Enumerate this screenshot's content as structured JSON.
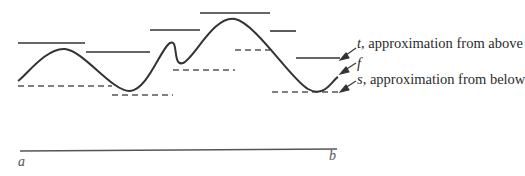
{
  "figure": {
    "colors": {
      "curve": "#333333",
      "steps": "#333333",
      "dashed": "#555555",
      "axis": "#555555"
    }
  },
  "labels": {
    "upper": {
      "symbol": "t",
      "text": ", approximation from above"
    },
    "curve": {
      "symbol": "f",
      "text": ""
    },
    "lower": {
      "symbol": "s",
      "text": ", approximation from below"
    },
    "interval_start": "a",
    "interval_end": "b"
  },
  "chart_data": {
    "type": "line",
    "title": "",
    "xlabel": "",
    "ylabel": "",
    "interval": [
      "a",
      "b"
    ],
    "curve_f": {
      "name": "f",
      "points_px": [
        [
          18,
          81
        ],
        [
          65,
          49
        ],
        [
          130,
          91
        ],
        [
          170,
          43
        ],
        [
          183,
          63
        ],
        [
          235,
          19
        ],
        [
          308,
          89
        ],
        [
          338,
          77
        ]
      ]
    },
    "upper_step_t": {
      "name": "t, approximation from above",
      "style": "solid",
      "segments_px": [
        [
          18,
          85,
          43
        ],
        [
          86,
          150,
          52
        ],
        [
          150,
          200,
          30
        ],
        [
          200,
          270,
          13
        ],
        [
          270,
          296,
          31
        ],
        [
          296,
          340,
          58
        ]
      ]
    },
    "lower_step_s": {
      "name": "s, approximation from below",
      "style": "dashed",
      "segments_px": [
        [
          18,
          112,
          86
        ],
        [
          112,
          173,
          95
        ],
        [
          173,
          235,
          70
        ],
        [
          235,
          270,
          50
        ],
        [
          272,
          338,
          92
        ]
      ]
    },
    "baseline_px": {
      "x1": 20,
      "x2": 337,
      "y1": 151,
      "y2": 149
    }
  }
}
